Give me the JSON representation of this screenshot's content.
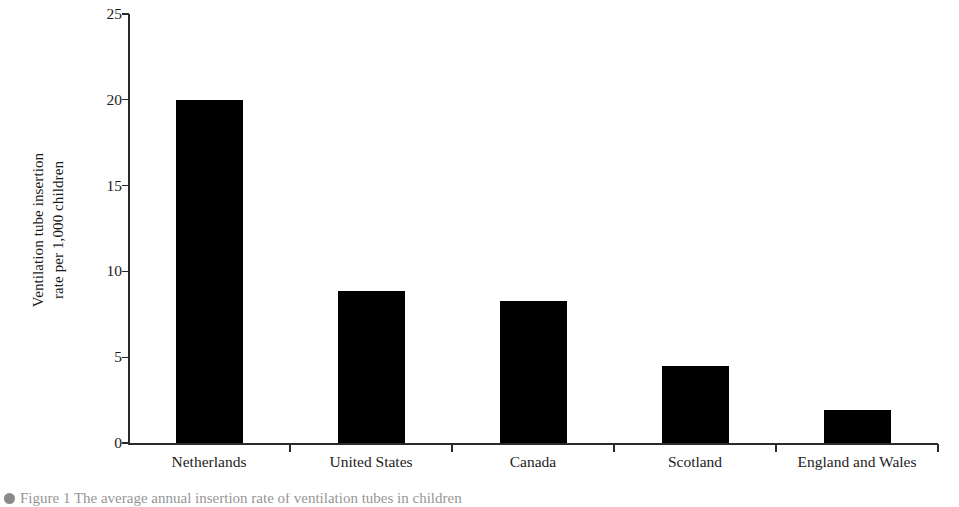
{
  "chart_data": {
    "type": "bar",
    "title": "",
    "xlabel": "",
    "ylabel": "Ventilation tube insertion rate per 1,000 children",
    "ylabel_line1": "Ventilation tube insertion",
    "ylabel_line2": "rate per 1,000 children",
    "categories": [
      "Netherlands",
      "United States",
      "Canada",
      "Scotland",
      "England and Wales"
    ],
    "values": [
      20.0,
      8.85,
      8.3,
      4.5,
      1.9
    ],
    "ylim": [
      0,
      25
    ],
    "yticks": [
      0,
      5,
      10,
      15,
      20,
      25
    ],
    "ytick_labels": [
      "0",
      "5",
      "10",
      "15",
      "20",
      "25"
    ],
    "grid": false,
    "legend": null,
    "bar_color": "#000000",
    "axis_color": "#2a2a2a",
    "background_color": "#ffffff"
  },
  "caption": {
    "text": "Figure 1 The average annual insertion rate of ventilation tubes in children"
  }
}
